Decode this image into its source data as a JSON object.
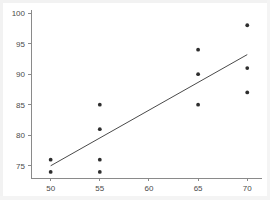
{
  "chart_data": {
    "type": "scatter",
    "title": "",
    "subtitle": "",
    "xlabel": "",
    "ylabel": "",
    "xlim": [
      48.0,
      71.5
    ],
    "ylim": [
      73.0,
      100.5
    ],
    "xticks": [
      50,
      55,
      60,
      65,
      70
    ],
    "xticklabels": [
      "50",
      "55",
      "60",
      "65",
      "70"
    ],
    "yticks": [
      75,
      80,
      85,
      90,
      95,
      100
    ],
    "yticklabels": [
      "75",
      "80",
      "85",
      "90",
      "95",
      "100"
    ],
    "grid": false,
    "legend": null,
    "marker": "filled-circle",
    "marker_color": "#2e2e2e",
    "points": [
      {
        "x": 50,
        "y": 76
      },
      {
        "x": 50,
        "y": 74
      },
      {
        "x": 55,
        "y": 85
      },
      {
        "x": 55,
        "y": 81
      },
      {
        "x": 55,
        "y": 76
      },
      {
        "x": 55,
        "y": 74
      },
      {
        "x": 65,
        "y": 94
      },
      {
        "x": 65,
        "y": 90
      },
      {
        "x": 65,
        "y": 85
      },
      {
        "x": 70,
        "y": 98
      },
      {
        "x": 70,
        "y": 91
      },
      {
        "x": 70,
        "y": 87
      }
    ],
    "series": [
      {
        "name": "observations",
        "type": "scatter",
        "x": [
          50,
          50,
          55,
          55,
          55,
          55,
          65,
          65,
          65,
          70,
          70,
          70
        ],
        "values": [
          76,
          74,
          85,
          81,
          76,
          74,
          94,
          90,
          85,
          98,
          91,
          87
        ]
      },
      {
        "name": "fit-line",
        "type": "line",
        "x": [
          50,
          70
        ],
        "values": [
          75.0,
          93.2
        ],
        "color": "#4a4a4a"
      }
    ],
    "fit_line": {
      "x_start": 50,
      "y_start": 75.0,
      "x_end": 70,
      "y_end": 93.2,
      "color": "#4a4a4a"
    },
    "colors": {
      "background": "#ffffff",
      "axis": "#8a8a8a",
      "tick_label": "#4a4a4a",
      "marker": "#2e2e2e",
      "fit_line": "#4a4a4a"
    }
  }
}
